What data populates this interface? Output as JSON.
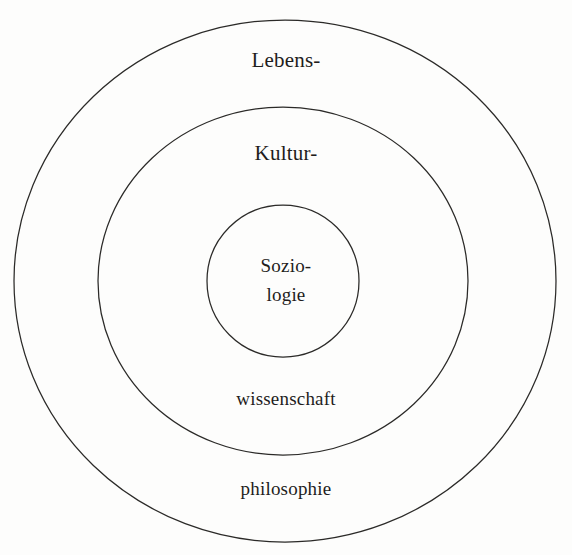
{
  "figure": {
    "type": "nested-circles-diagram",
    "language": "de",
    "background_color": "#fdfdfc",
    "stroke_color": "#2b2a28",
    "text_color": "#1f1d1c",
    "cropped_line_above": "· · · · · · · · ·",
    "rings": [
      {
        "id": "outer",
        "label": "Lebens-",
        "label_secondary": "philosophie",
        "full_term": "Lebensphilosophie",
        "center_x": 285,
        "center_y": 281,
        "radius": 268
      },
      {
        "id": "middle",
        "label": "Kultur-",
        "label_secondary": "wissenschaft",
        "full_term": "Kulturwissenschaft",
        "center_x": 283,
        "center_y": 281,
        "radius": 180
      },
      {
        "id": "inner",
        "label": "Sozio-",
        "label_secondary": "logie",
        "full_term": "Soziologie",
        "center_x": 283,
        "center_y": 281,
        "radius": 76
      }
    ],
    "labels": {
      "outer_top": "Lebens-",
      "middle_top": "Kultur-",
      "core_line_1": "Sozio-",
      "core_line_2": "logie",
      "middle_bottom": "wissenschaft",
      "outer_bottom": "philosophie"
    }
  }
}
